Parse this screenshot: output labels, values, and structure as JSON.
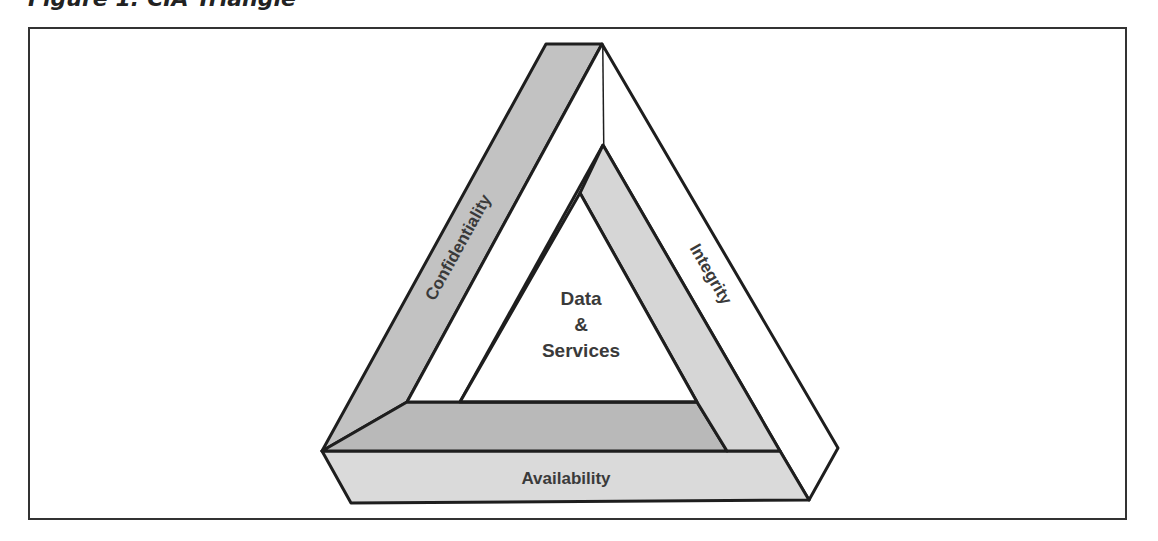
{
  "caption": "Figure 1: CIA Triangle",
  "diagram": {
    "type": "impossible-triangle",
    "center_label": {
      "line1": "Data",
      "line2": "&",
      "line3": "Services"
    },
    "sides": {
      "left": "Confidentiality",
      "right": "Integrity",
      "bottom": "Availability"
    },
    "colors": {
      "confidentiality_band": "#c2c2c2",
      "inner_right_band": "#d6d6d6",
      "inner_bottom_band": "#b9b9b9",
      "availability_face": "#dadada",
      "integrity_band": "#ffffff",
      "stroke": "#1e1e1e"
    }
  }
}
